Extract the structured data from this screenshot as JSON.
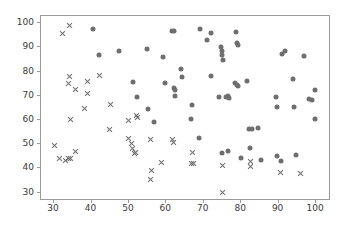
{
  "chart_data": {
    "type": "scatter",
    "title": "",
    "xlabel": "",
    "ylabel": "",
    "xlim": [
      26.5,
      104.0
    ],
    "ylim": [
      26.5,
      103.0
    ],
    "grid": false,
    "legend": null,
    "xticks": [
      30,
      40,
      50,
      60,
      70,
      80,
      90,
      100
    ],
    "yticks": [
      30,
      40,
      50,
      60,
      70,
      80,
      90,
      100
    ],
    "marker_color": "#6e6e6e",
    "series": [
      {
        "name": "cross-series",
        "marker": "x",
        "color": "#6e6e6e",
        "points": [
          [
            32.2,
            95.6
          ],
          [
            34.0,
            99.0
          ],
          [
            34.2,
            78.0
          ],
          [
            33.8,
            75.2
          ],
          [
            35.6,
            72.8
          ],
          [
            34.4,
            60.3
          ],
          [
            38.8,
            76.0
          ],
          [
            39.0,
            71.1
          ],
          [
            42.0,
            78.6
          ],
          [
            38.2,
            64.9
          ],
          [
            45.0,
            66.4
          ],
          [
            44.8,
            56.2
          ],
          [
            30.2,
            49.5
          ],
          [
            31.4,
            43.9
          ],
          [
            33.0,
            43.2
          ],
          [
            33.8,
            44.2
          ],
          [
            34.4,
            44.2
          ],
          [
            35.6,
            46.8
          ],
          [
            49.8,
            59.6
          ],
          [
            52.0,
            61.8
          ],
          [
            52.2,
            61.0
          ],
          [
            50.0,
            52.2
          ],
          [
            50.8,
            50.2
          ],
          [
            51.0,
            48.2
          ],
          [
            51.4,
            46.2
          ],
          [
            51.8,
            46.4
          ],
          [
            55.8,
            52.0
          ],
          [
            56.0,
            39.1
          ],
          [
            55.8,
            35.2
          ],
          [
            58.8,
            42.4
          ],
          [
            61.6,
            52.0
          ],
          [
            61.8,
            50.8
          ],
          [
            67.0,
            46.6
          ],
          [
            66.8,
            41.9
          ],
          [
            67.2,
            42.2
          ],
          [
            75.0,
            41.2
          ],
          [
            75.0,
            30.2
          ],
          [
            82.4,
            42.8
          ],
          [
            82.4,
            40.8
          ],
          [
            90.6,
            38.4
          ],
          [
            95.8,
            37.9
          ]
        ]
      },
      {
        "name": "dot-series",
        "marker": "o",
        "color": "#6e6e6e",
        "points": [
          [
            40.4,
            97.6
          ],
          [
            42.0,
            86.9
          ],
          [
            47.4,
            88.4
          ],
          [
            51.2,
            75.6
          ],
          [
            52.2,
            69.4
          ],
          [
            54.8,
            89.2
          ],
          [
            55.0,
            64.5
          ],
          [
            56.6,
            59.2
          ],
          [
            59.2,
            86.2
          ],
          [
            59.6,
            75.4
          ],
          [
            61.6,
            96.8
          ],
          [
            62.0,
            96.8
          ],
          [
            62.0,
            73.2
          ],
          [
            62.4,
            72.6
          ],
          [
            62.2,
            70.0
          ],
          [
            64.0,
            81.0
          ],
          [
            64.2,
            77.9
          ],
          [
            66.8,
            66.4
          ],
          [
            66.6,
            60.6
          ],
          [
            68.6,
            52.5
          ],
          [
            69.0,
            97.6
          ],
          [
            70.8,
            93.2
          ],
          [
            72.0,
            96.1
          ],
          [
            71.8,
            78.2
          ],
          [
            74.6,
            90.2
          ],
          [
            74.8,
            88.6
          ],
          [
            75.0,
            86.9
          ],
          [
            75.2,
            85.0
          ],
          [
            74.0,
            69.6
          ],
          [
            76.0,
            69.6
          ],
          [
            76.6,
            69.9
          ],
          [
            76.8,
            69.2
          ],
          [
            78.6,
            96.4
          ],
          [
            79.0,
            91.8
          ],
          [
            79.2,
            90.9
          ],
          [
            78.4,
            75.4
          ],
          [
            78.8,
            74.6
          ],
          [
            79.2,
            74.0
          ],
          [
            81.6,
            76.1
          ],
          [
            75.0,
            46.2
          ],
          [
            76.6,
            47.2
          ],
          [
            80.0,
            44.2
          ],
          [
            82.4,
            48.4
          ],
          [
            82.0,
            56.1
          ],
          [
            82.8,
            56.3
          ],
          [
            84.6,
            56.8
          ],
          [
            85.2,
            43.4
          ],
          [
            89.4,
            69.5
          ],
          [
            89.6,
            65.4
          ],
          [
            89.6,
            45.2
          ],
          [
            90.6,
            43.2
          ],
          [
            90.8,
            87.2
          ],
          [
            91.6,
            88.5
          ],
          [
            93.8,
            76.8
          ],
          [
            94.0,
            65.2
          ],
          [
            94.6,
            45.4
          ],
          [
            96.8,
            86.4
          ],
          [
            98.2,
            68.8
          ],
          [
            99.0,
            68.4
          ],
          [
            99.6,
            72.2
          ],
          [
            99.8,
            60.6
          ]
        ]
      }
    ]
  }
}
